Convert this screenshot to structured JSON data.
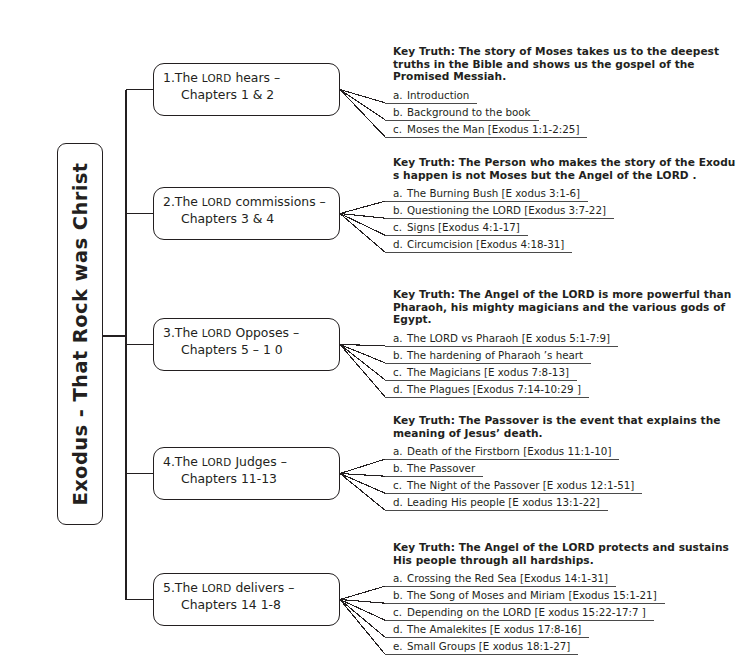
{
  "title": "Exodus - That Rock was Christ",
  "root": {
    "label": "Exodus - That Rock was Christ"
  },
  "sections": [
    {
      "number": "1.",
      "title_line1_pre": "The ",
      "title_line1_smallcaps": "LORD",
      "title_line1_post": " hears –",
      "title_line2": "Chapters  1 & 2",
      "key_truth": "Key Truth:  The story of Moses takes us to the deepest truths in the Bible and shows us the gospel of the Promised Messiah.",
      "items": [
        {
          "letter": "a.",
          "text": "Introduction"
        },
        {
          "letter": "b.",
          "text": "Background to the book"
        },
        {
          "letter": "c.",
          "text": "Moses the Man [Exodus 1:1-2:25]"
        }
      ]
    },
    {
      "number": "2.",
      "title_line1_pre": "The ",
      "title_line1_smallcaps": "LORD",
      "title_line1_post": " commissions   –",
      "title_line2": "Chapters 3 & 4",
      "key_truth": "Key Truth: The Person who makes the story of the Exodu s happen is  not  Moses but the Angel of the LORD .",
      "items": [
        {
          "letter": "a.",
          "text": "The Burning Bush [E xodus 3:1-6]"
        },
        {
          "letter": "b.",
          "text": "Questioning the LORD   [Exodus 3:7-22]"
        },
        {
          "letter": "c.",
          "text": "Signs [Exodus 4:1-17]"
        },
        {
          "letter": "d.",
          "text": "Circumcision [Exodus 4:18-31]"
        }
      ]
    },
    {
      "number": "3.",
      "title_line1_pre": "The ",
      "title_line1_smallcaps": "LORD",
      "title_line1_post": " Opposes –",
      "title_line2": "Chapters  5 – 1 0",
      "key_truth": "Key Truth: The Angel of the LORD is more powerful than Pharaoh, his mighty magicians and the various gods of Egypt.",
      "items": [
        {
          "letter": "a.",
          "text": "The LORD vs Pharaoh [E xodus 5:1-7:9]"
        },
        {
          "letter": "b.",
          "text": "The hardening of Pharaoh ’s heart"
        },
        {
          "letter": "c.",
          "text": "The Magicians [E xodus 7:8-13]"
        },
        {
          "letter": "d.",
          "text": "The Plagues [Exodus 7:14-10:29 ]"
        }
      ]
    },
    {
      "number": "4.",
      "title_line1_pre": "The ",
      "title_line1_smallcaps": "LORD",
      "title_line1_post": " Judges –",
      "title_line2": "Chapters  11-13",
      "key_truth": "Key Truth: The Passover is the event  that explains the meaning of Jesus’ death.",
      "items": [
        {
          "letter": "a.",
          "text": "Death of the Firstborn [Exodus 11:1-10]"
        },
        {
          "letter": "b.",
          "text": "The Passover"
        },
        {
          "letter": "c.",
          "text": "The Night of the Passover [E xodus 12:1-51]"
        },
        {
          "letter": "d.",
          "text": "Leading His people [E xodus 13:1-22]"
        }
      ]
    },
    {
      "number": "5.",
      "title_line1_pre": "The ",
      "title_line1_smallcaps": "LORD",
      "title_line1_post": " delivers –",
      "title_line2": "Chapters 14  1-8",
      "key_truth": "Key Truth: The Angel of the LORD protects and sustains His people  through all hardships.",
      "items": [
        {
          "letter": "a.",
          "text": "Crossing the Red Sea [Exodus 14:1-31]"
        },
        {
          "letter": "b.",
          "text": "The Song of Moses and Miriam  [Exodus 15:1-21]"
        },
        {
          "letter": "c.",
          "text": "Depending on the LORD  [E xodus 15:22-17:7 ]"
        },
        {
          "letter": "d.",
          "text": "The Amalekites [E xodus 17:8-16]"
        },
        {
          "letter": "e.",
          "text": "Small Groups [E xodus 18:1-27]"
        }
      ]
    }
  ],
  "colors": {
    "ink": "#231f20",
    "rule": "#4a4a4a",
    "background": "#ffffff"
  },
  "layout": {
    "branch_tops": [
      63,
      187,
      318,
      447,
      573
    ],
    "block_tops": [
      45,
      156,
      288,
      414,
      541
    ],
    "spine_x": 126,
    "root_wire_y": 336
  }
}
